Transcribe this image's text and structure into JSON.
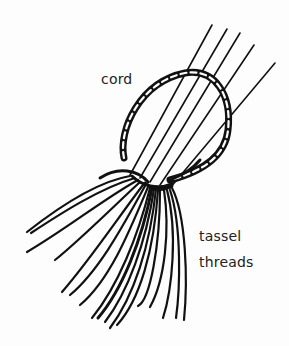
{
  "diagram": {
    "type": "illustration",
    "labels": {
      "cord": "cord",
      "tassel_line1": "tassel",
      "tassel_line2": "threads"
    },
    "colors": {
      "ink": "#111111",
      "background": "#fdfdfd",
      "text": "#222222"
    }
  }
}
